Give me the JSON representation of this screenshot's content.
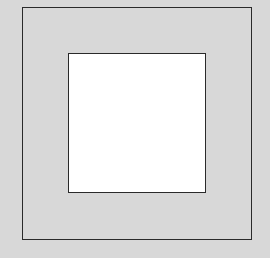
{
  "diagram": {
    "background_color": "#d8d8d8",
    "outer_square": {
      "fill": "#d8d8d8",
      "stroke": "#2a2a2a",
      "bounds": {
        "left": 22,
        "top": 7,
        "right": 251,
        "bottom": 240
      }
    },
    "inner_square": {
      "fill": "#ffffff",
      "stroke": "#2a2a2a",
      "bounds": {
        "left": 68,
        "top": 53,
        "right": 206,
        "bottom": 193
      }
    }
  }
}
